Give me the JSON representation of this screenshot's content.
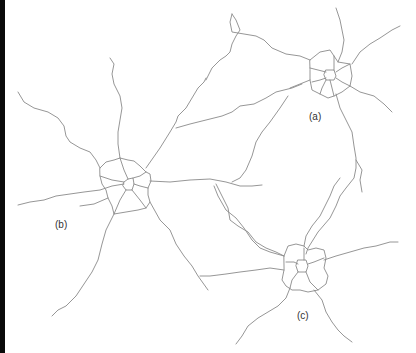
{
  "figure": {
    "colors": {
      "background": "#ffffff",
      "road": "#8a8a8a",
      "label": "#333333",
      "left_bar": "#0a0a0a"
    },
    "labels": [
      {
        "id": "a",
        "text": "(a)",
        "x": 309,
        "y": 112
      },
      {
        "id": "b",
        "text": "(b)",
        "x": 55,
        "y": 220
      },
      {
        "id": "c",
        "text": "(c)",
        "x": 297,
        "y": 311
      }
    ]
  }
}
